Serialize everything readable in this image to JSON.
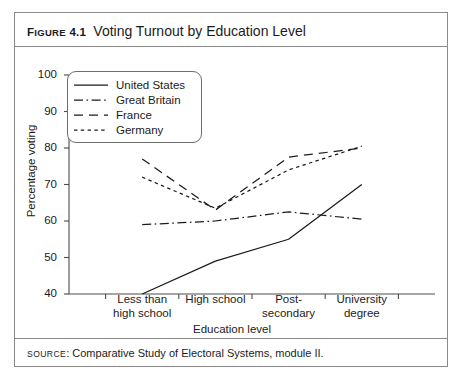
{
  "figure": {
    "label_prefix": "F",
    "label_rest": "IGURE",
    "number": "4.1",
    "title": "Voting Turnout by Education Level"
  },
  "source": {
    "word_prefix": "S",
    "word_rest": "OURCE",
    "text": ": Comparative Study of Electoral Systems, module II."
  },
  "chart_data": {
    "type": "line",
    "title": "Voting Turnout by Education Level",
    "xlabel": "Education level",
    "ylabel": "Percentage voting",
    "categories": [
      "Less than\nhigh school",
      "High school",
      "Post-\nsecondary",
      "University\ndegree"
    ],
    "category_lines": [
      [
        "Less than",
        "high school"
      ],
      [
        "High school",
        ""
      ],
      [
        "Post-",
        "secondary"
      ],
      [
        "University",
        "degree"
      ]
    ],
    "ylim": [
      40,
      100
    ],
    "yticks": [
      100,
      90,
      80,
      70,
      60,
      50,
      40
    ],
    "grid": false,
    "legend_position": "upper-left-inside",
    "series": [
      {
        "name": "United States",
        "style": "solid",
        "values": [
          40,
          49,
          55,
          70
        ]
      },
      {
        "name": "Great Britain",
        "style": "dashdot",
        "values": [
          59,
          60,
          62.5,
          60.5
        ]
      },
      {
        "name": "France",
        "style": "dashed",
        "values": [
          77,
          63,
          77.5,
          80
        ]
      },
      {
        "name": "Germany",
        "style": "dotted",
        "values": [
          72,
          63.5,
          74,
          80.5
        ]
      }
    ]
  },
  "colors": {
    "ink": "#1b1b1b",
    "axis": "#4c4c4c",
    "border": "#8a8a8a",
    "background": "#ffffff"
  }
}
